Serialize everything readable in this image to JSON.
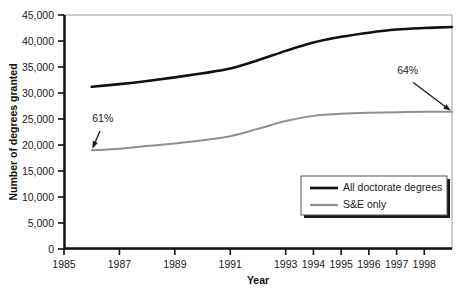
{
  "chart_data": {
    "type": "line",
    "title": "",
    "xlabel": "Year",
    "ylabel": "Number of degrees granted",
    "xlim": [
      1985,
      1999
    ],
    "ylim": [
      0,
      45000
    ],
    "grid": false,
    "legend_position": "bottom-right",
    "x_tick_labels": [
      "1985",
      "1987",
      "1989",
      "1991",
      "1993",
      "1994",
      "1995",
      "1996",
      "1997",
      "1998"
    ],
    "x_tick_values": [
      1985,
      1987,
      1989,
      1991,
      1993,
      1994,
      1995,
      1996,
      1997,
      1998
    ],
    "y_tick_labels": [
      "0",
      "5,000",
      "10,000",
      "15,000",
      "20,000",
      "25,000",
      "30,000",
      "35,000",
      "40,000",
      "45,000"
    ],
    "y_tick_values": [
      0,
      5000,
      10000,
      15000,
      20000,
      25000,
      30000,
      35000,
      40000,
      45000
    ],
    "x": [
      1986,
      1987,
      1988,
      1989,
      1990,
      1991,
      1992,
      1993,
      1994,
      1995,
      1996,
      1997,
      1998,
      1999
    ],
    "series": [
      {
        "name": "All doctorate degrees",
        "color": "#111111",
        "values": [
          31200,
          31700,
          32300,
          33000,
          33800,
          34700,
          36300,
          38100,
          39700,
          40800,
          41600,
          42200,
          42500,
          42700
        ]
      },
      {
        "name": "S&E only",
        "color": "#8f8f8f",
        "values": [
          19000,
          19300,
          19800,
          20300,
          20900,
          21700,
          23100,
          24600,
          25600,
          26000,
          26200,
          26300,
          26400,
          26400
        ]
      }
    ],
    "annotations": [
      {
        "text": "61%",
        "x": 1986,
        "y": 19000,
        "label_x": 1986.4,
        "label_y": 24400
      },
      {
        "text": "64%",
        "x": 1999,
        "y": 26400,
        "label_x": 1997.4,
        "label_y": 33600
      }
    ]
  },
  "legend": {
    "items": [
      {
        "label": "All doctorate degrees",
        "color": "#111111",
        "width": 2.6
      },
      {
        "label": "S&E only",
        "color": "#8f8f8f",
        "width": 2.2
      }
    ]
  },
  "axis": {
    "x_title": "Year",
    "y_title": "Number of degrees granted"
  }
}
